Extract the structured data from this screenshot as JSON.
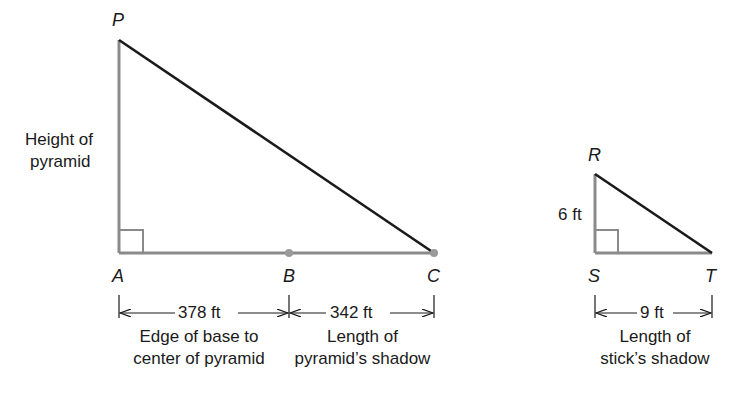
{
  "diagram": {
    "large_triangle": {
      "vertices": {
        "top": "P",
        "right_angle": "A",
        "mid": "B",
        "end": "C"
      },
      "side_label": [
        "Height of",
        "pyramid"
      ],
      "segments": [
        {
          "from": "A",
          "to": "B",
          "length": "378 ft",
          "caption": [
            "Edge of base to",
            "center of pyramid"
          ]
        },
        {
          "from": "B",
          "to": "C",
          "length": "342 ft",
          "caption": [
            "Length of",
            "pyramid’s shadow"
          ]
        }
      ]
    },
    "small_triangle": {
      "vertices": {
        "top": "R",
        "right_angle": "S",
        "end": "T"
      },
      "side_label": "6 ft",
      "segment": {
        "from": "S",
        "to": "T",
        "length": "9 ft",
        "caption": [
          "Length of",
          "stick’s shadow"
        ]
      }
    },
    "colors": {
      "hypotenuse": "#1a1a1a",
      "legs": "#8a8a8a",
      "points": "#9a9a9a"
    }
  }
}
